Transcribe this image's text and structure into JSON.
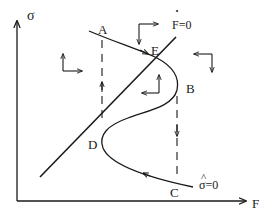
{
  "diagram": {
    "axes": {
      "y_label": "σ",
      "x_label": "F"
    },
    "points": {
      "A": "A",
      "B": "B",
      "C": "C",
      "D": "D",
      "E": "E"
    },
    "curves": {
      "f_dot_zero_label": "F=0",
      "f_dot_mark": "·",
      "sigma_hat_zero_label": "σ=0",
      "sigma_hat_mark": "^"
    },
    "colors": {
      "ink": "#1a1a1a",
      "background": "#ffffff"
    }
  }
}
